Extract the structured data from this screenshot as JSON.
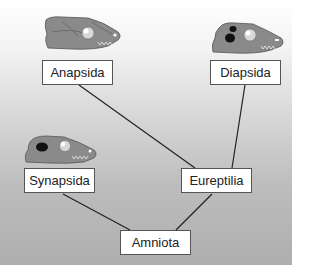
{
  "diagram": {
    "type": "cladogram",
    "nodes": [
      {
        "id": "anapsida",
        "label": "Anapsida",
        "skull": "anapsid-skull-icon"
      },
      {
        "id": "diapsida",
        "label": "Diapsida",
        "skull": "diapsid-skull-icon"
      },
      {
        "id": "synapsida",
        "label": "Synapsida",
        "skull": "synapsid-skull-icon"
      },
      {
        "id": "eureptilia",
        "label": "Eureptilia"
      },
      {
        "id": "amniota",
        "label": "Amniota"
      }
    ],
    "edges": [
      [
        "amniota",
        "synapsida"
      ],
      [
        "amniota",
        "eureptilia"
      ],
      [
        "eureptilia",
        "anapsida"
      ],
      [
        "eureptilia",
        "diapsida"
      ]
    ],
    "colors": {
      "skull": "#8a8a8a",
      "fenestra": "#111111",
      "line": "#222222"
    }
  }
}
